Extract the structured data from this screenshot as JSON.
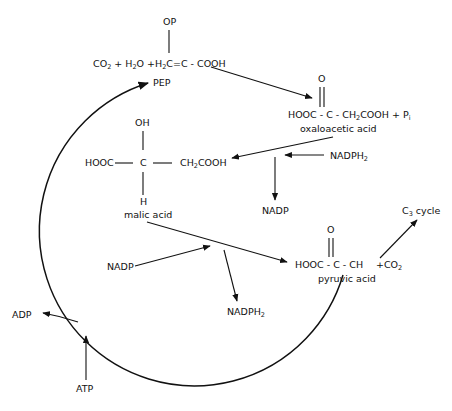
{
  "diagram": {
    "type": "C4 photosynthesis pathway (PEP carboxylation cycle)",
    "pep": {
      "op": "OP",
      "equation_prefix": "CO",
      "eq_sub1": "2",
      "eq_mid1": " + H",
      "eq_sub2": "2",
      "eq_mid2": "O +H",
      "eq_sub3": "2",
      "eq_end": "C=C - COOH",
      "label": "PEP"
    },
    "oxaloacetic": {
      "o": "O",
      "formula_a": "HOOC - C - CH",
      "sub": "2",
      "formula_b": "COOH + P",
      "sub_i": "i",
      "label": "oxaloacetic acid"
    },
    "malic": {
      "oh": "OH",
      "hooc": "HOOC",
      "c": "C",
      "ch": "CH",
      "sub": "2",
      "cooh": "COOH",
      "h": "H",
      "label": "malic acid"
    },
    "pyruvic": {
      "o": "O",
      "formula": "HOOC - C - CH",
      "co2": "+CO",
      "sub": "2",
      "label": "pyruvic acid"
    },
    "c3": {
      "c": "C",
      "sub": "3",
      "rest": " cycle"
    },
    "cofactors": {
      "nadph2_in": "NADPH",
      "nadph2_in_sub": "2",
      "nadp_out": "NADP",
      "nadp_in": "NADP",
      "nadph2_out": "NADPH",
      "nadph2_out_sub": "2",
      "adp": "ADP",
      "atp": "ATP"
    }
  }
}
